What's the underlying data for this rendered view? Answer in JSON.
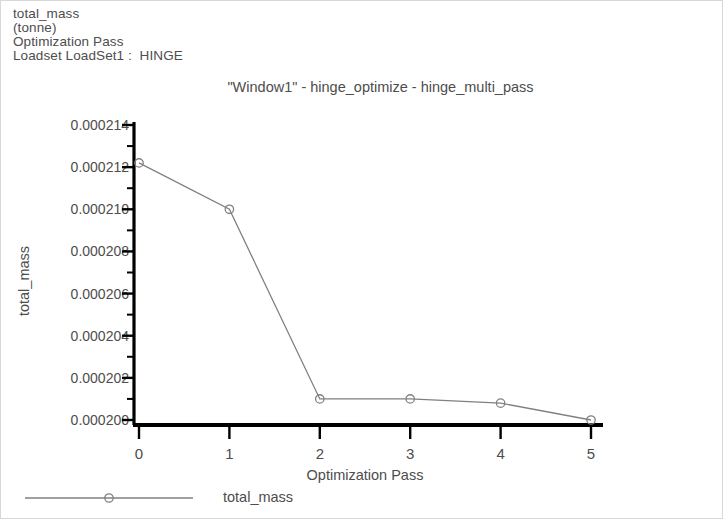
{
  "header": {
    "lines": [
      "total_mass",
      "(tonne)",
      "Optimization Pass",
      "Loadset LoadSet1 :  HINGE"
    ]
  },
  "chart_data": {
    "type": "line",
    "title": "\"Window1\" - hinge_optimize - hinge_multi_pass",
    "xlabel": "Optimization Pass",
    "ylabel": "total_mass",
    "units": "(tonne)",
    "x": [
      0,
      1,
      2,
      3,
      4,
      5
    ],
    "series": [
      {
        "name": "total_mass",
        "values": [
          0.0002122,
          0.00021,
          0.000201,
          0.000201,
          0.0002008,
          0.0002
        ],
        "color": "#808080",
        "marker": "circle"
      }
    ],
    "xlim": [
      0,
      5
    ],
    "ylim": [
      0.0002,
      0.000214
    ],
    "xticks": [
      "0",
      "1",
      "2",
      "3",
      "4",
      "5"
    ],
    "yticks": [
      "0.000214",
      "0.000212",
      "0.000210",
      "0.000208",
      "0.000206",
      "0.000204",
      "0.000202",
      "0.000200"
    ],
    "ytick_values": [
      0.000214,
      0.000212,
      0.00021,
      0.000208,
      0.000206,
      0.000204,
      0.000202,
      0.0002
    ],
    "minor_ticks_y": true,
    "grid": false,
    "legend_position": "bottom-left",
    "legend_entries": [
      "total_mass"
    ],
    "axis_color": "#000000"
  }
}
